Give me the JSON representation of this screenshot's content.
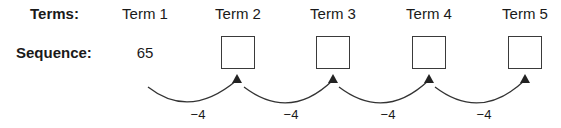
{
  "row_labels": {
    "terms": "Terms:",
    "sequence": "Sequence:"
  },
  "terms": [
    {
      "label": "Term 1",
      "value": "65"
    },
    {
      "label": "Term 2",
      "value": ""
    },
    {
      "label": "Term 3",
      "value": ""
    },
    {
      "label": "Term 4",
      "value": ""
    },
    {
      "label": "Term 5",
      "value": ""
    }
  ],
  "steps": [
    "−4",
    "−4",
    "−4",
    "−4"
  ]
}
